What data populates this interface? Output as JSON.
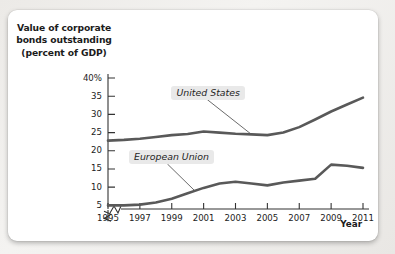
{
  "figure": {
    "title": "Value of corporate\nbonds outstanding\n(percent of GDP)",
    "x_axis_title": "Year",
    "y_top_label": "40%"
  },
  "chart_data": {
    "type": "line",
    "title": "Value of corporate bonds outstanding (percent of GDP)",
    "xlabel": "Year",
    "ylabel": "Value of corporate bonds outstanding (percent of GDP)",
    "x": [
      1995,
      1996,
      1997,
      1998,
      1999,
      2000,
      2001,
      2002,
      2003,
      2004,
      2005,
      2006,
      2007,
      2008,
      2009,
      2010,
      2011
    ],
    "xlim": [
      1995,
      2011
    ],
    "ylim": [
      4,
      40
    ],
    "yticks": [
      5,
      10,
      15,
      20,
      25,
      30,
      35,
      40
    ],
    "ytick_labels": [
      "5",
      "10",
      "15",
      "20",
      "25",
      "30",
      "35",
      "40%"
    ],
    "xticks": [
      1995,
      1997,
      1999,
      2001,
      2003,
      2005,
      2007,
      2009,
      2011
    ],
    "xtick_labels": [
      "1995",
      "1997",
      "1999",
      "2001",
      "2003",
      "2005",
      "2007",
      "2009",
      "2011"
    ],
    "grid": false,
    "legend": "inline-annotations",
    "axis_break_x": true,
    "axis_break_y": true,
    "series": [
      {
        "name": "United States",
        "color": "#595959",
        "values": [
          22.8,
          23.0,
          23.3,
          23.8,
          24.3,
          24.6,
          25.3,
          25.0,
          24.7,
          24.5,
          24.3,
          25.0,
          26.5,
          28.6,
          30.8,
          32.7,
          34.6
        ]
      },
      {
        "name": "European Union",
        "color": "#595959",
        "values": [
          5.0,
          5.0,
          5.2,
          5.8,
          6.8,
          8.3,
          9.8,
          11.0,
          11.5,
          11.0,
          10.5,
          11.3,
          11.8,
          12.3,
          16.2,
          15.9,
          15.3
        ]
      }
    ],
    "annotations": [
      {
        "text": "United States",
        "x": 2001.1,
        "y": 36.0
      },
      {
        "text": "European Union",
        "x": 1998.6,
        "y": 18.3
      }
    ]
  }
}
